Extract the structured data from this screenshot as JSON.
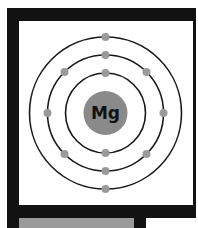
{
  "diagram": {
    "element_symbol": "Mg",
    "shells": [
      {
        "name": "shell-1",
        "electrons": 2
      },
      {
        "name": "shell-2",
        "electrons": 8
      },
      {
        "name": "shell-3",
        "electrons": 2
      }
    ],
    "colors": {
      "frame": "#121212",
      "nucleus": "#8a8a8a",
      "electron": "#9a9a9a",
      "orbit": "#1a1a1a",
      "panel": "#ffffff",
      "bottom_tile": "#9a9a9a"
    }
  }
}
